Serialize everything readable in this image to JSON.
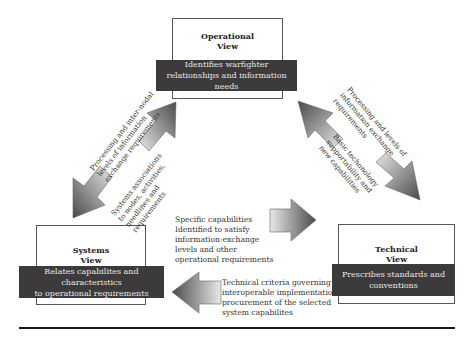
{
  "views": {
    "operational": {
      "title": "Operational\nView",
      "description": "Identifies warfighter\nrelationships and information needs"
    },
    "systems": {
      "title": "Systems\nView",
      "description": "Relates capabilites and characteristics\nto operational requirements"
    },
    "technical": {
      "title": "Technical\nView",
      "description": "Prescribes standards and\nconventions"
    }
  },
  "arrows": {
    "operational_to_systems": {
      "label": "Processing and inter-nodal\nlevels of information\nexchange requirements",
      "direction": "down-left"
    },
    "systems_to_operational": {
      "label": "Systems associations\nto nodes, activities,\nneedlines and\nrequirements",
      "direction": "up-right"
    },
    "operational_to_technical": {
      "label": "Processing and levels of\ninformation exchange\nrequirements",
      "direction": "down-right"
    },
    "technical_to_operational": {
      "label": "Basic techonology\nsupportability and\nnew capabilities",
      "direction": "up-left"
    },
    "systems_to_technical": {
      "label": "Specific capabilities\nIdentified to satisfy\ninformation-exchange\nlevels and other\noperational requirements",
      "direction": "right"
    },
    "technical_to_systems": {
      "label": "Technical criteria governing\ninteroperable implementation/\nprocurement of the selected\nsystem capabilites",
      "direction": "left"
    }
  },
  "colors": {
    "band_fill": "#3d3a3b",
    "band_text": "#e8e8e8",
    "box_border": "#555555",
    "arrow_dark": "#4a4a4a",
    "arrow_light": "#e6e6e6",
    "rule": "#1a1a1a"
  }
}
